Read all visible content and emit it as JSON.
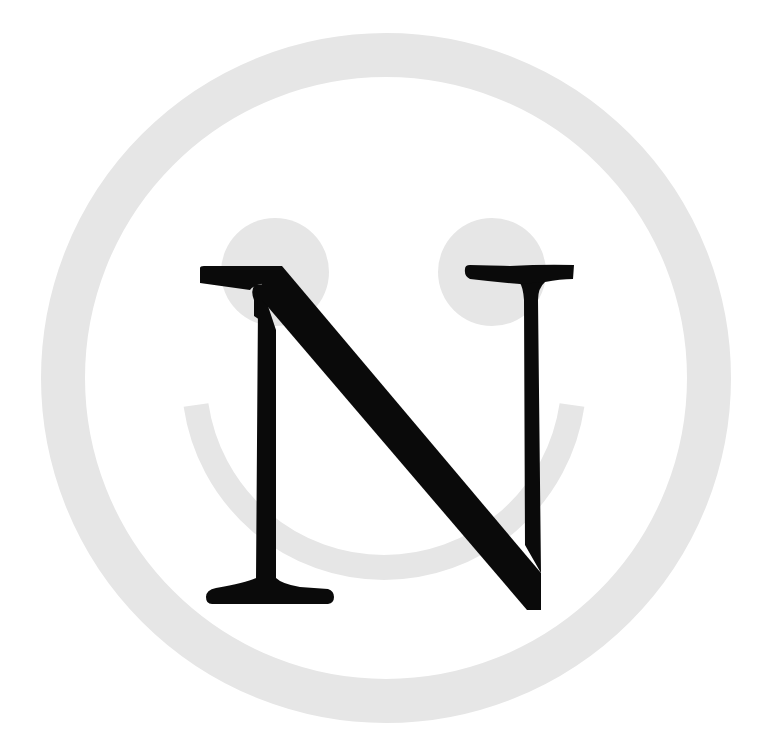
{
  "logo": {
    "letter": "N",
    "description": "Smiley face ring with serif letter N overlay",
    "colors": {
      "background": "#ffffff",
      "face": "#e6e6e6",
      "letter": "#0a0a0a"
    }
  }
}
